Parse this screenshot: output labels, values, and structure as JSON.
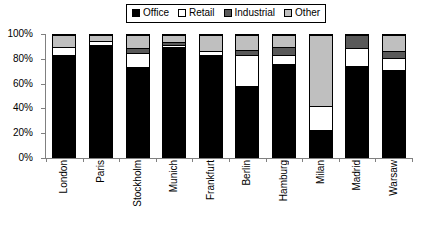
{
  "chart_data": {
    "type": "bar",
    "subtype": "stacked-100-percent",
    "title": "",
    "xlabel": "",
    "ylabel": "",
    "ylim": [
      0,
      100
    ],
    "ytick_labels": [
      "100%",
      "80%",
      "60%",
      "40%",
      "20%",
      "0%"
    ],
    "ytick_values": [
      100,
      80,
      60,
      40,
      20,
      0
    ],
    "grid": false,
    "legend_position": "top-center",
    "categories": [
      "London",
      "Paris",
      "Stockholm",
      "Munich",
      "Frankfurt",
      "Berlin",
      "Hamburg",
      "Milan",
      "Madrid",
      "Warsaw"
    ],
    "series": [
      {
        "name": "Office",
        "color": "#000000",
        "values": [
          84,
          92,
          74,
          90,
          84,
          58,
          76,
          22,
          75,
          71
        ]
      },
      {
        "name": "Retail",
        "color": "#ffffff",
        "values": [
          6,
          3,
          11,
          2,
          3,
          26,
          8,
          20,
          14,
          10
        ]
      },
      {
        "name": "Industrial",
        "color": "#595959",
        "values": [
          0,
          0,
          4,
          2,
          0,
          4,
          6,
          0,
          11,
          6
        ]
      },
      {
        "name": "Other",
        "color": "#bfbfbf",
        "values": [
          10,
          5,
          11,
          6,
          13,
          12,
          10,
          58,
          0,
          13
        ]
      }
    ]
  },
  "legend": {
    "items": [
      {
        "label": "Office",
        "swatch": "office-swatch"
      },
      {
        "label": "Retail",
        "swatch": "retail-swatch"
      },
      {
        "label": "Industrial",
        "swatch": "industrial-swatch"
      },
      {
        "label": "Other",
        "swatch": "other-swatch"
      }
    ]
  },
  "colors": {
    "office": "#000000",
    "retail": "#ffffff",
    "industrial": "#595959",
    "other": "#bfbfbf",
    "axis": "#808080",
    "background": "#ffffff"
  }
}
